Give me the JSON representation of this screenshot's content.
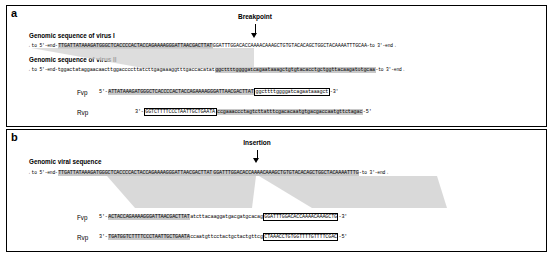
{
  "figure": {
    "panels": [
      {
        "label": "a",
        "marker": {
          "label": "Breakpoint"
        },
        "sections": [
          {
            "title": "Genomic sequence of virus I",
            "left_flank": "←to 5'-end-",
            "seq_pre": "TTGATTATAAAGATGGGCTCACCCCACTACCAGAAAAGGGATTAACGACTTAT",
            "seq_post": "GGATTTGGACACCAAAACAAAGCTGTGTACACAGCTGGCTACAAAATTTGCAA",
            "right_flank": "-to 3'-end→"
          },
          {
            "title": "Genomic sequence of virus II",
            "left_flank": "←to 5'-end-",
            "seq_pre": "tggactataggaacaacttggacccctt",
            "seq_mid": "atcttgagaaaggtttgaccacatat",
            "seq_post": "ggcttttggggatcagaataaagctgtgtacacctgctggttacaagatotgcaa",
            "right_flank": "-to 3'-end→"
          }
        ],
        "primers": [
          {
            "name": "Fvp",
            "prefix": "5'-",
            "seq_hl": "ATTATAAAGATGGGCTCACCCCACTACCAGAAAAGGGATTAACGACTTAT",
            "seq_box": "ggcttttggggatcagaataaagct",
            "suffix": "-3'"
          },
          {
            "name": "Rvp",
            "prefix": "3'-",
            "seq_box": "GGTCTTTTCCCTAATTGCTGAATA",
            "seq_hl": "ccgaaaccctagtcttatttcgacacaatgtgacgaccaatgttctagac",
            "suffix": "-5'"
          }
        ]
      },
      {
        "label": "b",
        "marker": {
          "label": "Insertion"
        },
        "sections": [
          {
            "title": "Genomic viral sequence",
            "left_flank": "←to 5'-end-",
            "seq_pre": "TTGATTATAAAGATGGGCTCACCCCACTACCAGAAAAGGGATTAACGACTTAT",
            "seq_post": "GGATTTGGACACCAAAACAAAGCTGTGTACACAGCTGGCTACAAAATTTG",
            "right_flank": "-to 3'-end→"
          }
        ],
        "primers": [
          {
            "name": "Fvp",
            "prefix": "5'-",
            "seq_hl": "ACTACCAGAAAAGGGATTAACGACTTAT",
            "seq_mid": "atcttacaaggatgacgatgcacag",
            "seq_box": "GGATTTGGACACCAAAACAAAGCTG",
            "suffix": "-3'"
          },
          {
            "name": "Rvp",
            "prefix": "3'-",
            "seq_box": "TGATGGTCTTTTCCCTAATTGCTGAATA",
            "seq_mid": "ccaatgttcctactgctactgttcg",
            "seq_box2": "CTAAACCTGTGGTTTTGTTTTCGAC",
            "suffix": "-5'"
          }
        ]
      }
    ],
    "colors": {
      "highlight": "#c8c8c8",
      "wedge": "#d0d0d0",
      "line": "#000000",
      "background": "#ffffff"
    }
  }
}
